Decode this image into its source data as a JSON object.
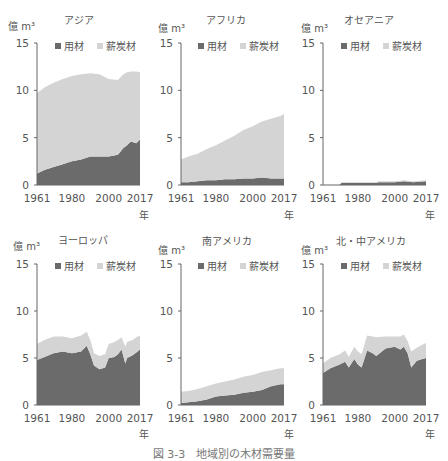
{
  "figure": {
    "caption": "図 3-3　地域別の木材需要量",
    "unit_label": "億 m³",
    "year_unit": "年",
    "legend": [
      {
        "label": "用材",
        "color": "#6b6b6b"
      },
      {
        "label": "薪炭材",
        "color": "#d4d4d4"
      }
    ]
  },
  "panels": [
    {
      "title": "アジア"
    },
    {
      "title": "アフリカ"
    },
    {
      "title": "オセアニア"
    },
    {
      "title": "ヨーロッパ"
    },
    {
      "title": "南アメリカ"
    },
    {
      "title": "北・中アメリカ"
    }
  ],
  "chart_data": [
    {
      "type": "area",
      "stacked": true,
      "title": "アジア",
      "xlabel": "年",
      "ylabel": "億 m³",
      "ylim": [
        0,
        15
      ],
      "yticks": [
        0,
        5,
        10,
        15
      ],
      "xticks": [
        1961,
        1980,
        2000,
        2017
      ],
      "x": [
        1961,
        1965,
        1970,
        1975,
        1980,
        1985,
        1990,
        1995,
        2000,
        2005,
        2008,
        2010,
        2012,
        2015,
        2017
      ],
      "series": [
        {
          "name": "用材",
          "values": [
            1.2,
            1.6,
            1.9,
            2.2,
            2.5,
            2.7,
            3.0,
            3.0,
            3.0,
            3.2,
            3.9,
            4.2,
            4.6,
            4.4,
            4.8
          ]
        },
        {
          "name": "薪炭材",
          "values": [
            8.5,
            8.7,
            8.9,
            9.0,
            9.0,
            9.0,
            8.8,
            8.7,
            8.2,
            7.9,
            7.8,
            7.7,
            7.4,
            7.6,
            7.1
          ]
        }
      ],
      "totals": [
        9.7,
        10.3,
        10.8,
        11.2,
        11.5,
        11.7,
        11.8,
        11.7,
        11.2,
        11.1,
        11.7,
        11.9,
        12.0,
        12.0,
        11.9
      ]
    },
    {
      "type": "area",
      "stacked": true,
      "title": "アフリカ",
      "xlabel": "年",
      "ylabel": "億 m³",
      "ylim": [
        0,
        15
      ],
      "yticks": [
        0,
        5,
        10,
        15
      ],
      "xticks": [
        1961,
        1980,
        2000,
        2017
      ],
      "x": [
        1961,
        1965,
        1970,
        1975,
        1980,
        1985,
        1990,
        1995,
        2000,
        2005,
        2010,
        2015,
        2017
      ],
      "series": [
        {
          "name": "用材",
          "values": [
            0.3,
            0.3,
            0.4,
            0.5,
            0.5,
            0.6,
            0.6,
            0.7,
            0.7,
            0.8,
            0.7,
            0.7,
            0.7
          ]
        },
        {
          "name": "薪炭材",
          "values": [
            2.4,
            2.7,
            2.9,
            3.3,
            3.7,
            4.1,
            4.6,
            5.1,
            5.5,
            5.9,
            6.3,
            6.6,
            6.8
          ]
        }
      ],
      "totals": [
        2.7,
        3.0,
        3.3,
        3.8,
        4.2,
        4.7,
        5.2,
        5.8,
        6.2,
        6.7,
        7.0,
        7.3,
        7.5
      ]
    },
    {
      "type": "area",
      "stacked": true,
      "title": "オセアニア",
      "xlabel": "年",
      "ylabel": "億 m³",
      "ylim": [
        0,
        15
      ],
      "yticks": [
        0,
        5,
        10,
        15
      ],
      "xticks": [
        1961,
        1980,
        2000,
        2017
      ],
      "x": [
        1961,
        1970,
        1971,
        1980,
        1990,
        1991,
        2000,
        2005,
        2010,
        2017
      ],
      "series": [
        {
          "name": "用材",
          "values": [
            0.0,
            0.0,
            0.2,
            0.2,
            0.2,
            0.3,
            0.3,
            0.4,
            0.3,
            0.4
          ]
        },
        {
          "name": "薪炭材",
          "values": [
            0.0,
            0.0,
            0.1,
            0.1,
            0.1,
            0.1,
            0.1,
            0.1,
            0.1,
            0.1
          ]
        }
      ],
      "totals": [
        0.0,
        0.0,
        0.3,
        0.3,
        0.3,
        0.4,
        0.4,
        0.5,
        0.4,
        0.5
      ]
    },
    {
      "type": "area",
      "stacked": true,
      "title": "ヨーロッパ",
      "xlabel": "年",
      "ylabel": "億 m³",
      "ylim": [
        0,
        15
      ],
      "yticks": [
        0,
        5,
        10,
        15
      ],
      "xticks": [
        1961,
        1980,
        2000,
        2017
      ],
      "x": [
        1961,
        1965,
        1970,
        1975,
        1980,
        1985,
        1988,
        1990,
        1992,
        1995,
        1998,
        2000,
        2003,
        2005,
        2007,
        2009,
        2010,
        2013,
        2015,
        2017
      ],
      "series": [
        {
          "name": "用材",
          "values": [
            4.8,
            5.1,
            5.5,
            5.7,
            5.5,
            5.7,
            6.3,
            5.4,
            4.2,
            3.8,
            4.0,
            5.0,
            5.1,
            5.4,
            5.9,
            4.4,
            5.0,
            5.3,
            5.6,
            5.9
          ]
        },
        {
          "name": "薪炭材",
          "values": [
            1.7,
            1.8,
            1.8,
            1.6,
            1.6,
            1.7,
            1.5,
            1.5,
            1.3,
            1.4,
            1.4,
            1.5,
            1.6,
            1.5,
            1.3,
            1.8,
            1.7,
            1.6,
            1.6,
            1.5
          ]
        }
      ],
      "totals": [
        6.5,
        6.9,
        7.3,
        7.3,
        7.1,
        7.4,
        7.8,
        6.9,
        5.5,
        5.2,
        5.4,
        6.5,
        6.7,
        6.9,
        7.2,
        6.2,
        6.7,
        6.9,
        7.2,
        7.4
      ]
    },
    {
      "type": "area",
      "stacked": true,
      "title": "南アメリカ",
      "xlabel": "年",
      "ylabel": "億 m³",
      "ylim": [
        0,
        15
      ],
      "yticks": [
        0,
        5,
        10,
        15
      ],
      "xticks": [
        1961,
        1980,
        2000,
        2017
      ],
      "x": [
        1961,
        1965,
        1970,
        1975,
        1980,
        1985,
        1990,
        1995,
        2000,
        2005,
        2010,
        2015,
        2017
      ],
      "series": [
        {
          "name": "用材",
          "values": [
            0.2,
            0.3,
            0.4,
            0.6,
            0.9,
            1.0,
            1.1,
            1.3,
            1.4,
            1.6,
            2.0,
            2.2,
            2.2
          ]
        },
        {
          "name": "薪炭材",
          "values": [
            1.2,
            1.2,
            1.3,
            1.4,
            1.4,
            1.5,
            1.6,
            1.7,
            1.8,
            1.9,
            1.7,
            1.7,
            1.7
          ]
        }
      ],
      "totals": [
        1.4,
        1.5,
        1.7,
        2.0,
        2.3,
        2.5,
        2.7,
        3.0,
        3.2,
        3.5,
        3.7,
        3.9,
        3.9
      ]
    },
    {
      "type": "area",
      "stacked": true,
      "title": "北・中アメリカ",
      "xlabel": "年",
      "ylabel": "億 m³",
      "ylim": [
        0,
        15
      ],
      "yticks": [
        0,
        5,
        10,
        15
      ],
      "xticks": [
        1961,
        1980,
        2000,
        2017
      ],
      "x": [
        1961,
        1965,
        1970,
        1973,
        1975,
        1978,
        1980,
        1982,
        1985,
        1988,
        1990,
        1995,
        2000,
        2003,
        2005,
        2007,
        2009,
        2012,
        2015,
        2017
      ],
      "series": [
        {
          "name": "用材",
          "values": [
            3.4,
            3.9,
            4.3,
            4.6,
            4.0,
            4.9,
            4.3,
            4.0,
            5.8,
            5.5,
            5.2,
            6.0,
            6.2,
            5.9,
            6.2,
            5.5,
            4.0,
            4.7,
            4.9,
            5.0
          ]
        },
        {
          "name": "薪炭材",
          "values": [
            1.0,
            1.1,
            1.1,
            1.2,
            1.1,
            1.3,
            1.4,
            1.4,
            1.6,
            1.8,
            2.0,
            1.3,
            1.1,
            1.4,
            1.3,
            1.3,
            1.7,
            1.4,
            1.5,
            1.6
          ]
        }
      ],
      "totals": [
        4.4,
        5.0,
        5.4,
        5.8,
        5.1,
        6.2,
        5.7,
        5.4,
        7.4,
        7.3,
        7.2,
        7.3,
        7.3,
        7.3,
        7.5,
        6.8,
        5.7,
        6.1,
        6.4,
        6.6
      ]
    }
  ]
}
